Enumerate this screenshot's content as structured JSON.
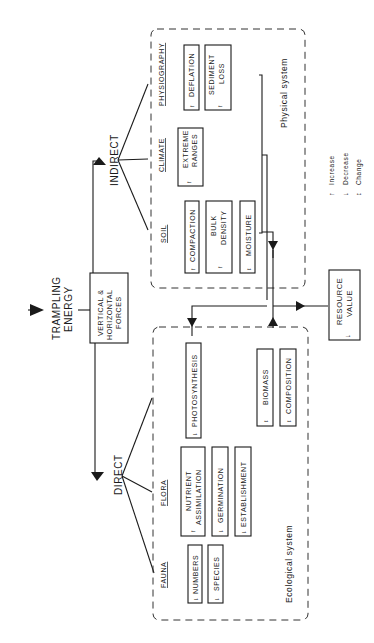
{
  "diagram": {
    "input": {
      "label_line1": "TRAMPLING",
      "label_line2": "ENERGY"
    },
    "forces": {
      "line1": "VERTICAL &",
      "line2": "HORIZONTAL",
      "line3": "FORCES"
    },
    "branches": {
      "indirect": "INDIRECT",
      "direct": "DIRECT"
    },
    "physical_system": {
      "title": "Physical   system",
      "categories": {
        "physiography": "PHYSIOGRAPHY",
        "climate": "CLIMATE",
        "soil": "SOIL"
      },
      "boxes": {
        "deflation": {
          "label": "DEFLATION",
          "arrow": "↑"
        },
        "sediment_loss": {
          "line1": "SEDIMENT",
          "line2": "LOSS",
          "arrow": "↑"
        },
        "extreme_ranges": {
          "line1": "EXTREME",
          "line2": "RANGES",
          "arrow": "↑"
        },
        "compaction": {
          "label": "COMPACTION",
          "arrow": "↑"
        },
        "bulk_density": {
          "line1": "BULK",
          "line2": "DENSITY",
          "arrow": "↑"
        },
        "moisture": {
          "label": "MOISTURE",
          "arrow": "↕"
        }
      }
    },
    "ecological_system": {
      "title": "Ecological   system",
      "categories": {
        "flora": "FLORA",
        "fauna": "FAUNA"
      },
      "boxes": {
        "photosynthesis": {
          "label": "PHOTOSYNTHESIS",
          "arrow": "↓"
        },
        "biomass": {
          "label": "BIOMASS",
          "arrow": "↕"
        },
        "composition": {
          "label": "COMPOSITION",
          "arrow": "↕"
        },
        "nutrient_assimilation": {
          "line1": "NUTRIENT",
          "line2": "ASSIMILATION",
          "arrow": "↑"
        },
        "germination": {
          "label": "GERMINATION",
          "arrow": "↓"
        },
        "establishment": {
          "label": "ESTABLISHMENT",
          "arrow": "↓"
        },
        "numbers": {
          "label": "NUMBERS",
          "arrow": "↓"
        },
        "species": {
          "label": "SPECIES",
          "arrow": "↓"
        }
      }
    },
    "output": {
      "line1": "RESOURCE",
      "line2": "VALUE",
      "arrow": "↓"
    },
    "legend": [
      {
        "symbol": "↑",
        "label": "Increase"
      },
      {
        "symbol": "↓",
        "label": "Decrease"
      },
      {
        "symbol": "↕",
        "label": "Change"
      }
    ]
  }
}
